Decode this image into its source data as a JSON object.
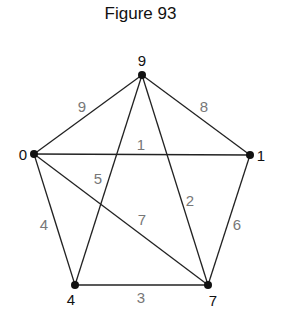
{
  "title": "Figure 93",
  "nodes": [
    {
      "id": "9",
      "label": "9",
      "x": 142,
      "y": 75,
      "lx": 142,
      "ly": 66,
      "anchor": "middle"
    },
    {
      "id": "0",
      "label": "0",
      "x": 34,
      "y": 154,
      "lx": 23,
      "ly": 160,
      "anchor": "middle"
    },
    {
      "id": "1",
      "label": "1",
      "x": 250,
      "y": 155,
      "lx": 261,
      "ly": 161,
      "anchor": "middle"
    },
    {
      "id": "4",
      "label": "4",
      "x": 75,
      "y": 285,
      "lx": 71,
      "ly": 305,
      "anchor": "middle"
    },
    {
      "id": "7",
      "label": "7",
      "x": 208,
      "y": 285,
      "lx": 213,
      "ly": 306,
      "anchor": "middle"
    }
  ],
  "edges": [
    {
      "from": "0",
      "to": "9",
      "weight": "9",
      "x1": 34,
      "y1": 154,
      "x2": 142,
      "y2": 75,
      "wx": 82,
      "wy": 112
    },
    {
      "from": "9",
      "to": "1",
      "weight": "8",
      "x1": 142,
      "y1": 75,
      "x2": 250,
      "y2": 155,
      "wx": 204,
      "wy": 112
    },
    {
      "from": "0",
      "to": "1",
      "weight": "1",
      "x1": 34,
      "y1": 154,
      "x2": 250,
      "y2": 155,
      "wx": 141,
      "wy": 150
    },
    {
      "from": "9",
      "to": "4",
      "weight": "5",
      "x1": 142,
      "y1": 75,
      "x2": 75,
      "y2": 285,
      "wx": 98,
      "wy": 184
    },
    {
      "from": "9",
      "to": "7",
      "weight": "2",
      "x1": 142,
      "y1": 75,
      "x2": 208,
      "y2": 285,
      "wx": 190,
      "wy": 206
    },
    {
      "from": "0",
      "to": "7",
      "weight": "7",
      "x1": 34,
      "y1": 154,
      "x2": 208,
      "y2": 285,
      "wx": 142,
      "wy": 225
    },
    {
      "from": "0",
      "to": "4",
      "weight": "4",
      "x1": 34,
      "y1": 154,
      "x2": 75,
      "y2": 285,
      "wx": 44,
      "wy": 230
    },
    {
      "from": "1",
      "to": "7",
      "weight": "6",
      "x1": 250,
      "y1": 155,
      "x2": 208,
      "y2": 285,
      "wx": 237,
      "wy": 230
    },
    {
      "from": "4",
      "to": "7",
      "weight": "3",
      "x1": 75,
      "y1": 285,
      "x2": 208,
      "y2": 285,
      "wx": 141,
      "wy": 303
    }
  ]
}
